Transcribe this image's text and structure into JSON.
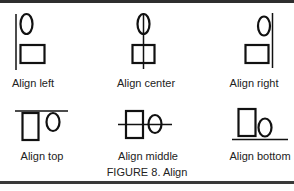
{
  "figure": {
    "caption": "FIGURE 8. Align",
    "items": [
      {
        "label": "Align left",
        "icon": "align-left-icon"
      },
      {
        "label": "Align center",
        "icon": "align-center-icon"
      },
      {
        "label": "Align right",
        "icon": "align-right-icon"
      },
      {
        "label": "Align top",
        "icon": "align-top-icon"
      },
      {
        "label": "Align middle",
        "icon": "align-middle-icon"
      },
      {
        "label": "Align bottom",
        "icon": "align-bottom-icon"
      }
    ]
  },
  "colors": {
    "stroke": "#111111",
    "border": "#2e2e2e",
    "background": "#ffffff",
    "text": "#222222"
  }
}
